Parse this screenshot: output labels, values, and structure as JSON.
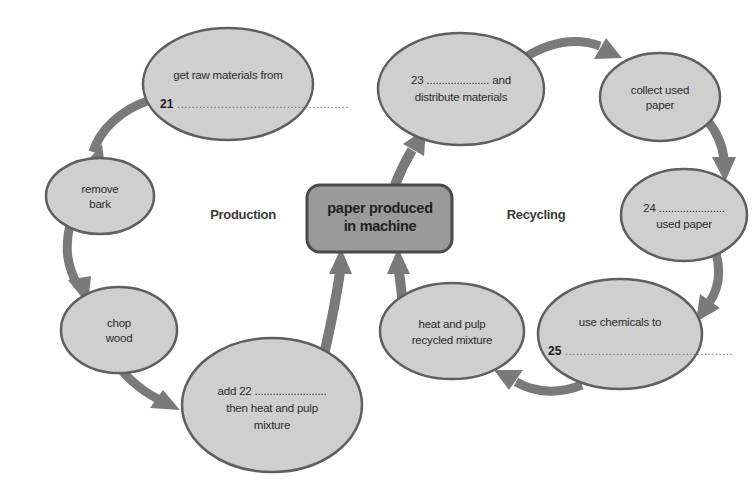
{
  "diagram": {
    "section_labels": {
      "left": "Production",
      "right": "Recycling"
    },
    "center_box": {
      "line1": "paper produced",
      "line2": "in machine"
    },
    "colors": {
      "node_fill": "#cfcfcf",
      "node_stroke": "#5f5f5f",
      "center_fill": "#9a9a9a",
      "center_stroke": "#4a4a4a",
      "arrow": "#7a7a7a",
      "text": "#2b2b2b",
      "background": "#ffffff"
    },
    "nodes": [
      {
        "id": "raw-materials",
        "lines": [
          "get raw materials from"
        ],
        "blank_number": "21",
        "blank_dots": "...............................................",
        "blank_position": "below"
      },
      {
        "id": "remove-bark",
        "lines": [
          "remove",
          "bark"
        ],
        "blank_number": "",
        "blank_dots": "",
        "blank_position": "none"
      },
      {
        "id": "chop-wood",
        "lines": [
          "chop",
          "wood"
        ],
        "blank_number": "",
        "blank_dots": "",
        "blank_position": "none"
      },
      {
        "id": "add-mixture",
        "lines": [
          "add 22 ........................",
          "then heat and pulp",
          "mixture"
        ],
        "blank_number": "22",
        "blank_dots": "........................",
        "blank_position": "inline-first"
      },
      {
        "id": "distribute-materials",
        "lines": [
          "23 ..................... and",
          "distribute materials"
        ],
        "blank_number": "23",
        "blank_dots": ".....................",
        "blank_position": "inline-first"
      },
      {
        "id": "collect-used-paper",
        "lines": [
          "collect used",
          "paper"
        ],
        "blank_number": "",
        "blank_dots": "",
        "blank_position": "none"
      },
      {
        "id": "used-paper",
        "lines": [
          "24 ......................",
          "used paper"
        ],
        "blank_number": "24",
        "blank_dots": "......................",
        "blank_position": "inline-first"
      },
      {
        "id": "use-chemicals",
        "lines": [
          "use chemicals to"
        ],
        "blank_number": "25",
        "blank_dots": "..............................................",
        "blank_position": "below"
      },
      {
        "id": "heat-pulp-recycled",
        "lines": [
          "heat and pulp",
          "recycled mixture"
        ],
        "blank_number": "",
        "blank_dots": "",
        "blank_position": "none"
      }
    ],
    "arrows": [
      {
        "id": "arrow-raw-to-bark",
        "from": "raw-materials",
        "to": "remove-bark"
      },
      {
        "id": "arrow-bark-to-chop",
        "from": "remove-bark",
        "to": "chop-wood"
      },
      {
        "id": "arrow-chop-to-add",
        "from": "chop-wood",
        "to": "add-mixture"
      },
      {
        "id": "arrow-add-to-machine",
        "from": "add-mixture",
        "to": "center-box"
      },
      {
        "id": "arrow-machine-to-distribute",
        "from": "center-box",
        "to": "distribute-materials"
      },
      {
        "id": "arrow-distribute-to-collect",
        "from": "distribute-materials",
        "to": "collect-used-paper"
      },
      {
        "id": "arrow-collect-to-used",
        "from": "collect-used-paper",
        "to": "used-paper"
      },
      {
        "id": "arrow-used-to-chemicals",
        "from": "used-paper",
        "to": "use-chemicals"
      },
      {
        "id": "arrow-chemicals-to-heat",
        "from": "use-chemicals",
        "to": "heat-pulp-recycled"
      },
      {
        "id": "arrow-heat-to-machine",
        "from": "heat-pulp-recycled",
        "to": "center-box"
      }
    ]
  }
}
